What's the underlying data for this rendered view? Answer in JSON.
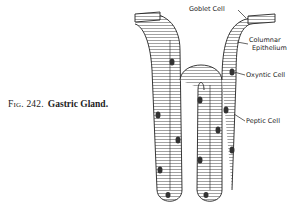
{
  "caption": {
    "figure_number": "Fig. 242.",
    "title": "Gastric Gland."
  },
  "labels": {
    "goblet_cell": "Goblet Cell",
    "columnar_epithelium_line1": "Columnar",
    "columnar_epithelium_line2": "Epithelium",
    "oxyntic_cell": "Oxyntic Cell",
    "peptic_cell": "Peptic Cell"
  },
  "colors": {
    "ink": "#222222",
    "background": "#ffffff"
  }
}
